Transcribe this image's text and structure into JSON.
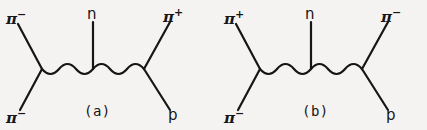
{
  "figure": {
    "background_color": "#f4f3f1",
    "stroke_color": "#161616",
    "width": 427,
    "height": 130
  },
  "diagrams": [
    {
      "caption": "(a)",
      "caption_x": 84,
      "caption_y": 104,
      "vertex_left": {
        "x": 42,
        "y": 69
      },
      "vertex_right": {
        "x": 144,
        "y": 69
      },
      "vertex_mid": {
        "x": 93,
        "y": 69
      },
      "propagator": {
        "type": "wavy",
        "x1": 42,
        "x2": 144,
        "y": 69,
        "amplitude": 5,
        "wavelength": 17
      },
      "legs": [
        {
          "name": "incoming-pion-upper-left",
          "x1": 42,
          "y1": 69,
          "x2": 18,
          "y2": 24
        },
        {
          "name": "incoming-pion-lower-left",
          "x1": 42,
          "y1": 69,
          "x2": 20,
          "y2": 110
        },
        {
          "name": "outgoing-pion-upper-right",
          "x1": 144,
          "y1": 69,
          "x2": 170,
          "y2": 22
        },
        {
          "name": "outgoing-proton-lower-right",
          "x1": 144,
          "y1": 69,
          "x2": 170,
          "y2": 110
        },
        {
          "name": "neutron-vertical",
          "x1": 93,
          "y1": 22,
          "x2": 93,
          "y2": 69
        }
      ],
      "labels": [
        {
          "name": "label-pi-minus-upper-left",
          "base": "π",
          "sup": "−",
          "style": "particle",
          "x": 6,
          "y": 9
        },
        {
          "name": "label-pi-minus-lower-left",
          "base": "π",
          "sup": "−",
          "style": "particle",
          "x": 6,
          "y": 108
        },
        {
          "name": "label-neutron",
          "base": "n",
          "sup": "",
          "style": "plain",
          "x": 87,
          "y": 7
        },
        {
          "name": "label-pi-plus-upper-right",
          "base": "π",
          "sup": "+",
          "style": "particle",
          "x": 163,
          "y": 7
        },
        {
          "name": "label-proton",
          "base": "p",
          "sup": "",
          "style": "plain",
          "x": 168,
          "y": 108
        }
      ]
    },
    {
      "caption": "(b)",
      "caption_x": 302,
      "caption_y": 104,
      "vertex_left": {
        "x": 260,
        "y": 69
      },
      "vertex_right": {
        "x": 362,
        "y": 69
      },
      "vertex_mid": {
        "x": 311,
        "y": 69
      },
      "propagator": {
        "type": "wavy",
        "x1": 260,
        "x2": 362,
        "y": 69,
        "amplitude": 5,
        "wavelength": 17
      },
      "legs": [
        {
          "name": "incoming-pion-upper-left",
          "x1": 260,
          "y1": 69,
          "x2": 236,
          "y2": 24
        },
        {
          "name": "incoming-pion-lower-left",
          "x1": 260,
          "y1": 69,
          "x2": 238,
          "y2": 110
        },
        {
          "name": "outgoing-pion-upper-right",
          "x1": 362,
          "y1": 69,
          "x2": 388,
          "y2": 22
        },
        {
          "name": "outgoing-proton-lower-right",
          "x1": 362,
          "y1": 69,
          "x2": 388,
          "y2": 110
        },
        {
          "name": "neutron-vertical",
          "x1": 311,
          "y1": 22,
          "x2": 311,
          "y2": 69
        }
      ],
      "labels": [
        {
          "name": "label-pi-plus-upper-left",
          "base": "π",
          "sup": "+",
          "style": "particle",
          "x": 224,
          "y": 9
        },
        {
          "name": "label-pi-minus-lower-left",
          "base": "π",
          "sup": "−",
          "style": "particle",
          "x": 224,
          "y": 108
        },
        {
          "name": "label-neutron",
          "base": "n",
          "sup": "",
          "style": "plain",
          "x": 305,
          "y": 7
        },
        {
          "name": "label-pi-minus-upper-right",
          "base": "π",
          "sup": "−",
          "style": "particle",
          "x": 381,
          "y": 7
        },
        {
          "name": "label-proton",
          "base": "p",
          "sup": "",
          "style": "plain",
          "x": 386,
          "y": 108
        }
      ]
    }
  ]
}
